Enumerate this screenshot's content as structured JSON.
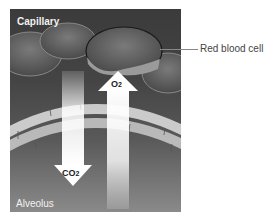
{
  "diagram": {
    "title_labels": {
      "top": "Capillary",
      "bottom": "Alveolus"
    },
    "callouts": [
      {
        "label": "Red blood cell",
        "target": "red-blood-cell"
      }
    ],
    "arrows": [
      {
        "id": "o2",
        "direction": "up",
        "label": "O",
        "subscript": "2"
      },
      {
        "id": "co2",
        "direction": "down",
        "label": "CO",
        "subscript": "2"
      }
    ],
    "colors": {
      "background_top": "#3b3b3b",
      "background_bottom": "#8a8a8a",
      "arrow_fill": "#ffffff",
      "membrane": "#cfcfcf",
      "cell": "#6a6a6a"
    }
  }
}
